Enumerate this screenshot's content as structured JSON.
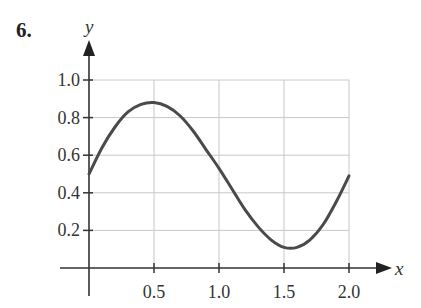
{
  "question_number": "6.",
  "chart_data": {
    "type": "line",
    "title": "",
    "xlabel": "x",
    "ylabel": "y",
    "xlim": [
      0,
      2.0
    ],
    "ylim": [
      0,
      1.0
    ],
    "grid": true,
    "x_ticks": [
      "0.5",
      "1.0",
      "1.5",
      "2.0"
    ],
    "y_ticks": [
      "0.2",
      "0.4",
      "0.6",
      "0.8",
      "1.0"
    ],
    "series": [
      {
        "name": "curve",
        "x": [
          0.0,
          0.1,
          0.2,
          0.3,
          0.4,
          0.5,
          0.6,
          0.7,
          0.8,
          0.9,
          1.0,
          1.1,
          1.2,
          1.3,
          1.4,
          1.5,
          1.6,
          1.7,
          1.8,
          1.9,
          2.0
        ],
        "values": [
          0.5,
          0.64,
          0.75,
          0.83,
          0.87,
          0.88,
          0.86,
          0.81,
          0.73,
          0.63,
          0.53,
          0.42,
          0.31,
          0.22,
          0.15,
          0.11,
          0.11,
          0.15,
          0.23,
          0.35,
          0.49
        ]
      }
    ]
  },
  "colors": {
    "curve": "#4a4a4a",
    "axis": "#333333",
    "grid": "#c8c8c8"
  }
}
